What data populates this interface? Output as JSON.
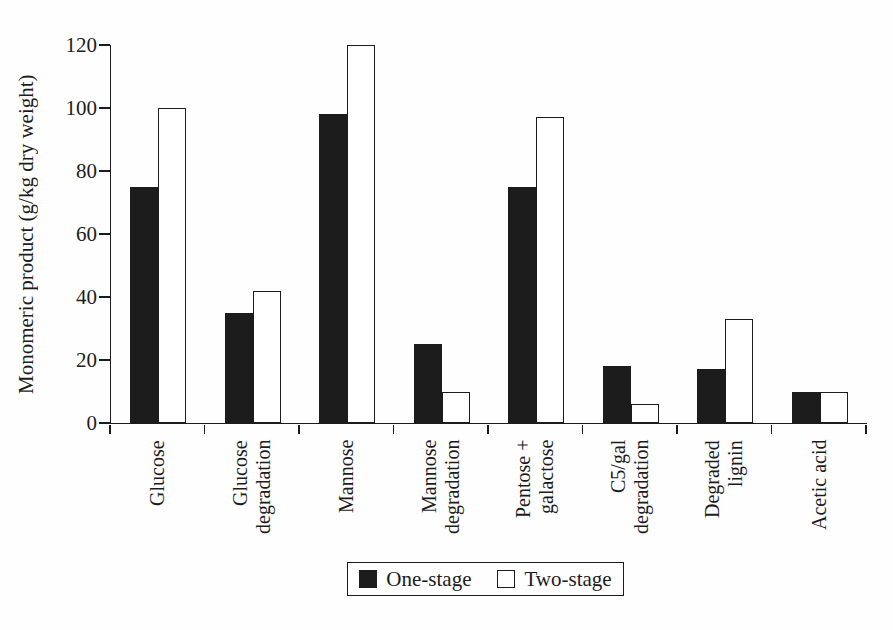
{
  "figure": {
    "background": "#fefefe",
    "ink_color": "#1c1c1c"
  },
  "chart_data": {
    "type": "bar",
    "title": "",
    "xlabel": "",
    "ylabel": "Monomeric product (g/kg dry weight)",
    "ylim": [
      0,
      120
    ],
    "yticks": [
      0,
      20,
      40,
      60,
      80,
      100,
      120
    ],
    "grid": false,
    "legend_position": "bottom-center",
    "categories": [
      "Glucose",
      "Glucose degradation",
      "Mannose",
      "Mannose degradation",
      "Pentose + galactose",
      "C5/gal degradation",
      "Degraded lignin",
      "Acetic acid"
    ],
    "categories_lines": [
      [
        "Glucose"
      ],
      [
        "Glucose",
        "degradation"
      ],
      [
        "Mannose"
      ],
      [
        "Mannose",
        "degradation"
      ],
      [
        "Pentose +",
        "galactose"
      ],
      [
        "C5/gal",
        "degradation"
      ],
      [
        "Degraded",
        "lignin"
      ],
      [
        "Acetic acid"
      ]
    ],
    "series": [
      {
        "name": "One-stage",
        "fill": "#1c1c1c",
        "values": [
          75,
          35,
          98,
          25,
          75,
          18,
          17,
          10
        ]
      },
      {
        "name": "Two-stage",
        "fill": "#ffffff",
        "values": [
          100,
          42,
          120,
          10,
          97,
          6,
          33,
          10
        ]
      }
    ]
  }
}
